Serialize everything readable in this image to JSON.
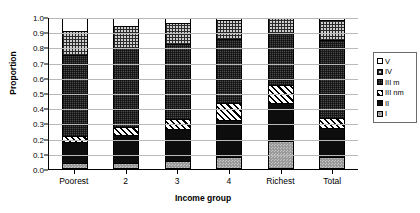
{
  "chart_data": {
    "type": "bar",
    "subtype": "stacked-bar-proportion",
    "title": "",
    "xlabel": "Income group",
    "ylabel": "Proportion",
    "ylim": [
      0.0,
      1.0
    ],
    "ytick_labels": [
      "0.0",
      "0.1",
      "0.2",
      "0.3",
      "0.4",
      "0.5",
      "0.6",
      "0.7",
      "0.8",
      "0.9",
      "1.0"
    ],
    "ytick_values": [
      0.0,
      0.1,
      0.2,
      0.3,
      0.4,
      0.5,
      0.6,
      0.7,
      0.8,
      0.9,
      1.0
    ],
    "grid": true,
    "grid_axis": "y",
    "legend_position": "right",
    "categories": [
      "Poorest",
      "2",
      "3",
      "4",
      "Richest",
      "Total"
    ],
    "series": [
      {
        "name": "I",
        "values": [
          0.025,
          0.03,
          0.04,
          0.07,
          0.175,
          0.065
        ]
      },
      {
        "name": "II",
        "values": [
          0.14,
          0.185,
          0.215,
          0.245,
          0.255,
          0.2
        ]
      },
      {
        "name": "III nm",
        "values": [
          0.045,
          0.055,
          0.07,
          0.115,
          0.12,
          0.065
        ]
      },
      {
        "name": "III m",
        "values": [
          0.545,
          0.53,
          0.5,
          0.43,
          0.35,
          0.525
        ]
      },
      {
        "name": "IV",
        "values": [
          0.16,
          0.145,
          0.14,
          0.125,
          0.1,
          0.13
        ]
      },
      {
        "name": "V",
        "values": [
          0.085,
          0.055,
          0.035,
          0.015,
          0.0,
          0.015
        ]
      }
    ],
    "cumulative_tops": {
      "Poorest": {
        "I": 0.025,
        "II": 0.165,
        "III nm": 0.21,
        "III m": 0.755,
        "IV": 0.915,
        "V": 1.0
      },
      "2": {
        "I": 0.03,
        "II": 0.215,
        "III nm": 0.27,
        "III m": 0.8,
        "IV": 0.945,
        "V": 1.0
      },
      "3": {
        "I": 0.04,
        "II": 0.255,
        "III nm": 0.325,
        "III m": 0.825,
        "IV": 0.965,
        "V": 1.0
      },
      "4": {
        "I": 0.07,
        "II": 0.315,
        "III nm": 0.43,
        "III m": 0.86,
        "IV": 0.985,
        "V": 1.0
      },
      "Richest": {
        "I": 0.175,
        "II": 0.43,
        "III nm": 0.55,
        "III m": 0.9,
        "IV": 1.0,
        "V": 1.0
      },
      "Total": {
        "I": 0.065,
        "II": 0.265,
        "III nm": 0.33,
        "III m": 0.855,
        "IV": 0.985,
        "V": 1.0
      }
    },
    "legend": {
      "entries": [
        {
          "label": "V",
          "swatch": "swatch-white-plain"
        },
        {
          "label": "IV",
          "swatch": "swatch-fine-grid"
        },
        {
          "label": "III m",
          "swatch": "swatch-dark-grid"
        },
        {
          "label": "III nm",
          "swatch": "swatch-diagonal-hatch"
        },
        {
          "label": "II",
          "swatch": "swatch-solid-black"
        },
        {
          "label": "I",
          "swatch": "swatch-gray-checker"
        }
      ]
    },
    "colors": {
      "I": "#9a9a9a",
      "II": "#0d0d0d",
      "III nm": "#ffffff",
      "III m": "#4a4a4a",
      "IV": "#cfcfcf",
      "V": "#ffffff",
      "gridline": "#b9b9b9",
      "axis": "#000000",
      "background": "#ffffff"
    }
  }
}
